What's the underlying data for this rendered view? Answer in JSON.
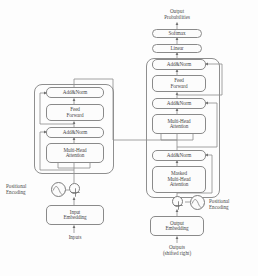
{
  "figure": {
    "type": "block-diagram",
    "stroke_color": "#8a8a8a",
    "text_color": "#4a4a4a",
    "background_color": "#fdfdfd"
  },
  "encoder": {
    "name": "Encoder stack",
    "blocks": [
      {
        "id": "enc_addnorm_2",
        "label": "Add&Norm"
      },
      {
        "id": "enc_ff",
        "line1": "Feed",
        "line2": "Forward"
      },
      {
        "id": "enc_addnorm_1",
        "label": "Add&Norm"
      },
      {
        "id": "enc_mha",
        "line1": "Multi-Head",
        "line2": "Attention"
      }
    ],
    "positional_encoding": {
      "line1": "Positional",
      "line2": "Encoding"
    },
    "embedding": {
      "line1": "Input",
      "line2": "Embedding"
    },
    "input_label": "Inputs",
    "sum_symbol": "⊕"
  },
  "decoder": {
    "name": "Decoder stack",
    "output_probabilities": {
      "line1": "Output",
      "line2": "Probabilities"
    },
    "softmax": {
      "label": "Softmax"
    },
    "linear": {
      "label": "Linear"
    },
    "blocks": [
      {
        "id": "dec_addnorm_3",
        "label": "Add&Norm"
      },
      {
        "id": "dec_ff",
        "line1": "Feed",
        "line2": "Forward"
      },
      {
        "id": "dec_addnorm_2",
        "label": "Add&Norm"
      },
      {
        "id": "dec_mha",
        "line1": "Multi-Head",
        "line2": "Attention"
      },
      {
        "id": "dec_addnorm_1",
        "label": "Add&Norm"
      },
      {
        "id": "dec_masked_mha",
        "line1": "Masked",
        "line2": "Multi-Head",
        "line3": "Attention"
      }
    ],
    "positional_encoding": {
      "line1": "Positional",
      "line2": "Encoding"
    },
    "embedding": {
      "line1": "Output",
      "line2": "Embedding"
    },
    "output_label": {
      "line1": "Outputs",
      "line2": "(shifted right)"
    },
    "sum_symbol": "⊕"
  }
}
